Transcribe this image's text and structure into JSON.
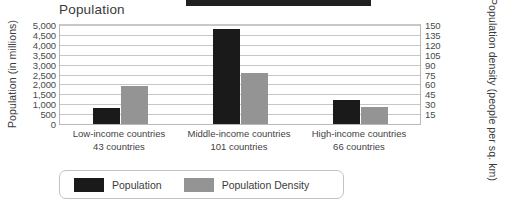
{
  "chart_data": {
    "type": "bar",
    "title": "Population",
    "xlabel": "",
    "categories": [
      "Low-income countries",
      "Middle-income countries",
      "High-income countries"
    ],
    "category_sublabels": [
      "43 countries",
      "101 countries",
      "66 countries"
    ],
    "series": [
      {
        "name": "Population",
        "axis": "left",
        "unit": "millions",
        "values": [
          800,
          4800,
          1200
        ]
      },
      {
        "name": "Population Density",
        "axis": "right",
        "unit": "people per sq. km",
        "values": [
          57,
          78,
          26
        ]
      }
    ],
    "left_axis": {
      "label": "Population (in millions)",
      "ylim": [
        0,
        5000
      ],
      "ticks": [
        "0",
        "500",
        "1,000",
        "1,500",
        "2,000",
        "2,500",
        "3,000",
        "3,500",
        "4,000",
        "4,500",
        "5,000"
      ]
    },
    "right_axis": {
      "label": "Population density (people per sq. km)",
      "ylim": [
        0,
        150
      ],
      "ticks": [
        "15",
        "30",
        "45",
        "60",
        "75",
        "90",
        "105",
        "120",
        "135",
        "150"
      ]
    },
    "grid": true,
    "legend_position": "bottom-left",
    "colors": {
      "population": "#1b1a1a",
      "population_density": "#949494",
      "gridline": "#c7c7c7",
      "frame": "#b9b9b9"
    }
  },
  "legend": {
    "items": [
      {
        "label": "Population"
      },
      {
        "label": "Population Density"
      }
    ]
  }
}
